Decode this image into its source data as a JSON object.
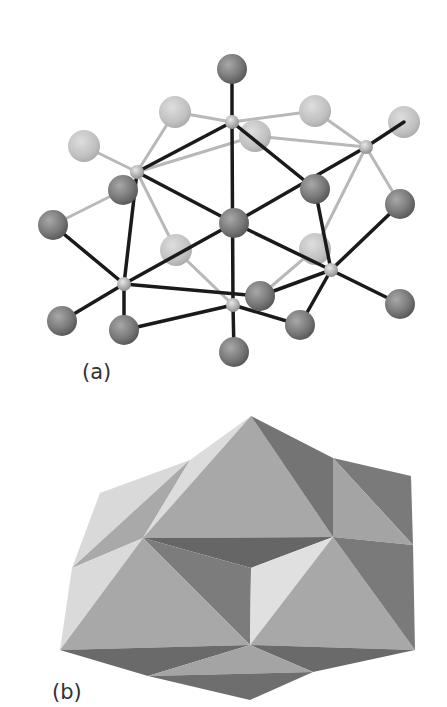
{
  "figure": {
    "panels": [
      {
        "id": "a",
        "label": "(a)",
        "type": "ball-and-stick cluster structure"
      },
      {
        "id": "b",
        "label": "(b)",
        "type": "polyhedral representation"
      }
    ]
  },
  "colors": {
    "dark_atom": "#7a7a7a",
    "light_atom": "#c2c2c2",
    "small_node": "#b0b0b0",
    "bond_front": "#1a1a1a",
    "bond_back": "#b8b8b8",
    "face_light": "#d9d9d9",
    "face_mid": "#a6a6a6",
    "face_dark": "#6e6e6e"
  }
}
